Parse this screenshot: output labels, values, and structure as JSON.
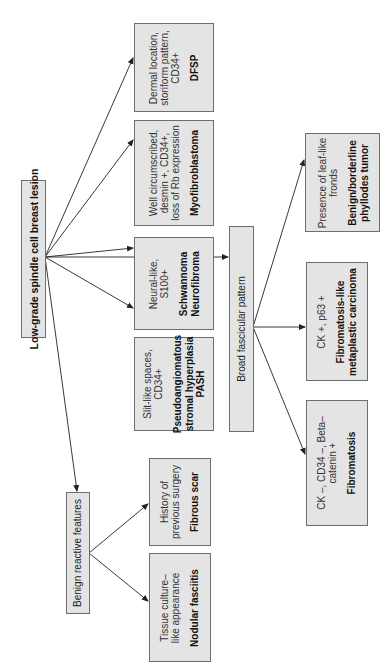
{
  "diagram": {
    "orientation": "rotated-90-ccw",
    "colors": {
      "box_fill": "#e4e4e4",
      "box_border": "#6e6e6e",
      "line": "#222222",
      "background": "#ffffff"
    },
    "root": {
      "label": "Low-grade spindle cell breast lesion"
    },
    "benign_reactive": {
      "label": "Benign reactive features",
      "children": [
        {
          "criteria": [
            "History of",
            "previous surgery"
          ],
          "diagnosis": [
            "Fibrous scar"
          ]
        },
        {
          "criteria": [
            "Tissue culture–",
            "like appearance"
          ],
          "diagnosis": [
            "Nodular fasciitis"
          ]
        }
      ]
    },
    "direct_children": [
      {
        "criteria": [
          "Dermal location,",
          "storiform pattern,",
          "CD34+"
        ],
        "diagnosis": [
          "DFSP"
        ]
      },
      {
        "criteria": [
          "Well circumscribed,",
          "desmin +, CD34+,",
          "loss of Rb expression"
        ],
        "diagnosis": [
          "Myofibroblastoma"
        ]
      },
      {
        "criteria": [
          "Neural-like,",
          "S100+"
        ],
        "diagnosis": [
          "Schwannoma",
          "Neurofibroma"
        ]
      },
      {
        "criteria": [
          "Slit-like spaces,",
          "CD34+"
        ],
        "diagnosis": [
          "Pseudoangiomatous",
          "stromal hyperplasia",
          "PASH"
        ]
      }
    ],
    "broad_fascicular": {
      "label": "Broad fascicular pattern",
      "children": [
        {
          "criteria": [
            "Presence of leaf-like",
            "fronds"
          ],
          "diagnosis": [
            "Benign/borderline",
            "phyllodes tumor"
          ]
        },
        {
          "criteria": [
            "CK +, p63 +"
          ],
          "diagnosis": [
            "Fibromatosis-like",
            "metaplastic carcinoma"
          ]
        },
        {
          "criteria": [
            "CK –, CD34 –, Beta–",
            "catenin +"
          ],
          "diagnosis": [
            "Fibromatosis"
          ]
        }
      ]
    }
  }
}
